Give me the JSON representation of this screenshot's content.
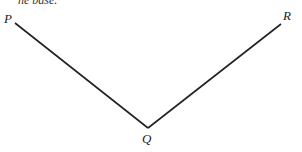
{
  "caption_fragment": "he base.",
  "diagram": {
    "labels": {
      "P": "P",
      "Q": "Q",
      "R": "R"
    },
    "points": {
      "P": [
        15,
        23
      ],
      "Q": [
        148,
        128
      ],
      "R": [
        281,
        24
      ]
    },
    "stroke": "#222222"
  }
}
